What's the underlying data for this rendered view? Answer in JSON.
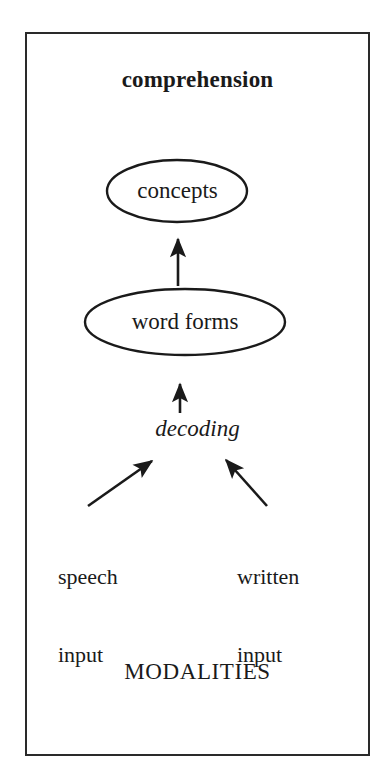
{
  "figure": {
    "type": "flow-diagram",
    "background_color": "#ffffff",
    "ink_color": "#1a1a1a",
    "frame": {
      "border_color": "#2a2a2a",
      "x": 25,
      "y": 32,
      "width": 345,
      "height": 724
    },
    "title": "comprehension",
    "bottom_caption": "MODALITIES",
    "nodes": [
      {
        "id": "concepts",
        "label": "concepts",
        "shape": "ellipse",
        "cx": 177,
        "cy": 191,
        "rx": 70,
        "ry": 31,
        "style": "regular"
      },
      {
        "id": "word-forms",
        "label": "word forms",
        "shape": "ellipse",
        "cx": 185,
        "cy": 322,
        "rx": 100,
        "ry": 33,
        "style": "regular"
      },
      {
        "id": "decoding",
        "label": "decoding",
        "shape": "text",
        "cx": 180,
        "cy": 432,
        "style": "italic"
      },
      {
        "id": "speech-input",
        "label": "speech\ninput",
        "line1": "speech",
        "line2": "input",
        "shape": "text",
        "x": 58,
        "y": 512,
        "style": "regular"
      },
      {
        "id": "written-input",
        "label": "written\ninput",
        "line1": "written",
        "line2": "input",
        "shape": "text",
        "x": 237,
        "y": 512,
        "style": "regular"
      }
    ],
    "edges": [
      {
        "id": "word-forms-to-concepts",
        "from": "word-forms",
        "to": "concepts",
        "kind": "arrow",
        "direction": "up",
        "x1": 178,
        "y1": 286,
        "x2": 178,
        "y2": 236
      },
      {
        "id": "decoding-to-word-forms",
        "from": "decoding",
        "to": "word-forms",
        "kind": "arrow",
        "direction": "up",
        "x1": 180,
        "y1": 413,
        "x2": 180,
        "y2": 381
      },
      {
        "id": "speech-input-to-decoding",
        "from": "speech-input",
        "to": "decoding",
        "kind": "arrow",
        "direction": "up-right",
        "x1": 88,
        "y1": 506,
        "x2": 156,
        "y2": 458
      },
      {
        "id": "written-input-to-decoding",
        "from": "written-input",
        "to": "decoding",
        "kind": "arrow",
        "direction": "up-left",
        "x1": 267,
        "y1": 506,
        "x2": 222,
        "y2": 456
      }
    ]
  }
}
